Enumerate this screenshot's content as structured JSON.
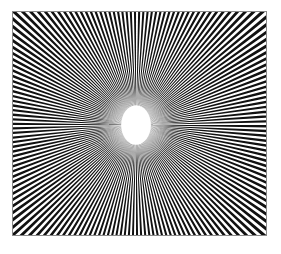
{
  "figure": {
    "type": "radial-spoke-pattern",
    "frame": {
      "left": 12,
      "top": 11,
      "width": 255,
      "height": 225,
      "border_color": "#8a8a8a",
      "background": "#ffffff"
    },
    "pattern": {
      "spoke_count": 170,
      "spoke_color": "#111111",
      "gap_color": "#ffffff",
      "center_x": 124,
      "center_y": 114,
      "center_ellipse": {
        "rx": 15,
        "ry": 20,
        "fill": "#ffffff"
      },
      "blur_halo": {
        "radius": 38,
        "color": "#ffffff",
        "opacity": 0.55
      }
    }
  }
}
